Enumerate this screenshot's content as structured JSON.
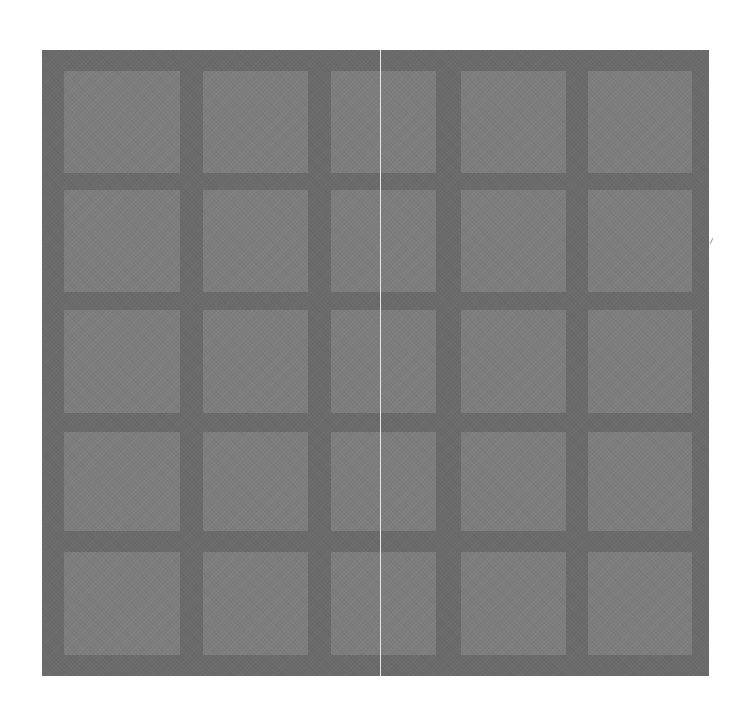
{
  "image": {
    "description": "Gray grid panel of 5x5 lighter square tiles separated by darker gutters, with a thin light vertical seam near the center",
    "colors": {
      "background": "#ffffff",
      "frame": "#6b6b6b",
      "tile": "#7d7d7d",
      "seam": "#e6e6e6",
      "mark": "#9a9a9a"
    },
    "frame": {
      "left": 42,
      "top": 50,
      "right": 709,
      "bottom": 676
    },
    "columns": [
      {
        "left": 64,
        "right": 180
      },
      {
        "left": 203,
        "right": 308
      },
      {
        "left": 331,
        "right": 436
      },
      {
        "left": 461,
        "right": 566
      },
      {
        "left": 588,
        "right": 692
      }
    ],
    "rows": [
      {
        "top": 71,
        "bottom": 173
      },
      {
        "top": 190,
        "bottom": 292
      },
      {
        "top": 310,
        "bottom": 413
      },
      {
        "top": 432,
        "bottom": 531
      },
      {
        "top": 552,
        "bottom": 655
      }
    ],
    "seam": {
      "x": 380,
      "top": 50,
      "bottom": 676
    },
    "mark": {
      "x": 711,
      "y": 238
    }
  }
}
